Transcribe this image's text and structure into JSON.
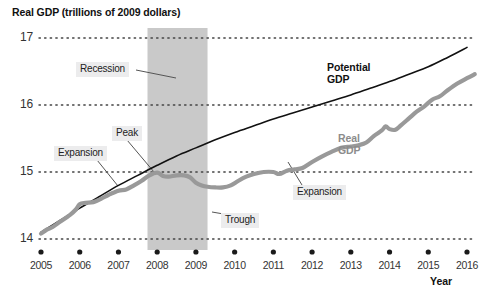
{
  "chart_data": {
    "type": "line",
    "title": "Real GDP (trillions of 2009 dollars)",
    "xlabel": "Year",
    "ylabel": "Real GDP (trillions of 2009 dollars)",
    "xlim": [
      2005,
      2016
    ],
    "ylim": [
      13.75,
      17.15
    ],
    "yticks": [
      "14",
      "15",
      "16",
      "17"
    ],
    "ytick_values": [
      14,
      15,
      16,
      17
    ],
    "xticks": [
      "2005",
      "2006",
      "2007",
      "2008",
      "2009",
      "2010",
      "2011",
      "2012",
      "2013",
      "2014",
      "2015",
      "2016"
    ],
    "grid": "horizontal-dotted",
    "legend": "inline-labels",
    "shaded_regions": [
      {
        "label": "Recession",
        "x_start": 2007.75,
        "x_end": 2009.3,
        "color": "#c9c9c9"
      }
    ],
    "series": [
      {
        "name": "Potential GDP",
        "color": "#111111",
        "width": 1.6,
        "points": [
          [
            2005.0,
            14.1
          ],
          [
            2005.5,
            14.28
          ],
          [
            2006.0,
            14.46
          ],
          [
            2006.5,
            14.63
          ],
          [
            2007.0,
            14.8
          ],
          [
            2007.5,
            14.95
          ],
          [
            2008.0,
            15.1
          ],
          [
            2008.5,
            15.24
          ],
          [
            2009.0,
            15.36
          ],
          [
            2009.5,
            15.48
          ],
          [
            2010.0,
            15.59
          ],
          [
            2010.5,
            15.69
          ],
          [
            2011.0,
            15.79
          ],
          [
            2011.5,
            15.88
          ],
          [
            2012.0,
            15.97
          ],
          [
            2012.5,
            16.06
          ],
          [
            2013.0,
            16.15
          ],
          [
            2013.5,
            16.25
          ],
          [
            2014.0,
            16.35
          ],
          [
            2014.5,
            16.46
          ],
          [
            2015.0,
            16.57
          ],
          [
            2015.5,
            16.71
          ],
          [
            2016.0,
            16.86
          ]
        ]
      },
      {
        "name": "Real GDP",
        "color": "#999999",
        "width": 4.2,
        "points": [
          [
            2005.0,
            14.08
          ],
          [
            2005.15,
            14.14
          ],
          [
            2005.3,
            14.18
          ],
          [
            2005.5,
            14.26
          ],
          [
            2005.75,
            14.36
          ],
          [
            2005.9,
            14.44
          ],
          [
            2006.0,
            14.52
          ],
          [
            2006.15,
            14.54
          ],
          [
            2006.35,
            14.55
          ],
          [
            2006.55,
            14.6
          ],
          [
            2006.75,
            14.66
          ],
          [
            2007.0,
            14.72
          ],
          [
            2007.2,
            14.74
          ],
          [
            2007.4,
            14.8
          ],
          [
            2007.6,
            14.87
          ],
          [
            2007.8,
            14.95
          ],
          [
            2008.0,
            14.99
          ],
          [
            2008.15,
            14.94
          ],
          [
            2008.3,
            14.93
          ],
          [
            2008.5,
            14.95
          ],
          [
            2008.7,
            14.95
          ],
          [
            2008.85,
            14.92
          ],
          [
            2009.0,
            14.84
          ],
          [
            2009.15,
            14.8
          ],
          [
            2009.3,
            14.78
          ],
          [
            2009.5,
            14.77
          ],
          [
            2009.7,
            14.77
          ],
          [
            2009.9,
            14.8
          ],
          [
            2010.1,
            14.87
          ],
          [
            2010.3,
            14.93
          ],
          [
            2010.5,
            14.97
          ],
          [
            2010.75,
            15.0
          ],
          [
            2011.0,
            15.0
          ],
          [
            2011.15,
            14.97
          ],
          [
            2011.35,
            15.02
          ],
          [
            2011.55,
            15.04
          ],
          [
            2011.75,
            15.06
          ],
          [
            2012.0,
            15.15
          ],
          [
            2012.25,
            15.23
          ],
          [
            2012.5,
            15.3
          ],
          [
            2012.75,
            15.36
          ],
          [
            2013.0,
            15.38
          ],
          [
            2013.2,
            15.4
          ],
          [
            2013.4,
            15.44
          ],
          [
            2013.6,
            15.54
          ],
          [
            2013.8,
            15.62
          ],
          [
            2013.9,
            15.68
          ],
          [
            2014.0,
            15.64
          ],
          [
            2014.15,
            15.63
          ],
          [
            2014.3,
            15.7
          ],
          [
            2014.5,
            15.8
          ],
          [
            2014.7,
            15.9
          ],
          [
            2014.9,
            15.98
          ],
          [
            2015.1,
            16.08
          ],
          [
            2015.3,
            16.13
          ],
          [
            2015.5,
            16.22
          ],
          [
            2015.75,
            16.32
          ],
          [
            2016.0,
            16.4
          ],
          [
            2016.2,
            16.46
          ]
        ]
      }
    ],
    "annotations": [
      {
        "label": "Recession",
        "kind": "boxed-callout",
        "points_to": "shaded recession band"
      },
      {
        "label": "Peak",
        "kind": "boxed-callout",
        "points_to": "Real GDP peak at 2007.9, 15.0"
      },
      {
        "label": "Expansion",
        "kind": "boxed-callout",
        "points_to": "Real GDP rising 2006-2007"
      },
      {
        "label": "Trough",
        "kind": "boxed-callout",
        "points_to": "Real GDP trough at 2009.5, 14.77"
      },
      {
        "label": "Expansion",
        "kind": "boxed-callout",
        "points_to": "Real GDP rising 2012-2013"
      },
      {
        "label": "Potential\nGDP",
        "kind": "series-label",
        "points_to": "black potential GDP line"
      },
      {
        "label": "Real\nGDP",
        "kind": "series-label",
        "points_to": "gray real GDP line"
      }
    ]
  },
  "labels": {
    "title": "Real GDP (trillions of 2009 dollars)",
    "x_axis_name": "Year",
    "potential_gdp_line1": "Potential",
    "potential_gdp_line2": "GDP",
    "real_gdp_line1": "Real",
    "real_gdp_line2": "GDP",
    "callout_recession": "Recession",
    "callout_peak": "Peak",
    "callout_expansion_1": "Expansion",
    "callout_trough": "Trough",
    "callout_expansion_2": "Expansion"
  },
  "colors": {
    "potential": "#111111",
    "real": "#999999",
    "recession_band": "#c9c9c9",
    "gridline": "#444444",
    "callout_bg": "#ececed"
  }
}
